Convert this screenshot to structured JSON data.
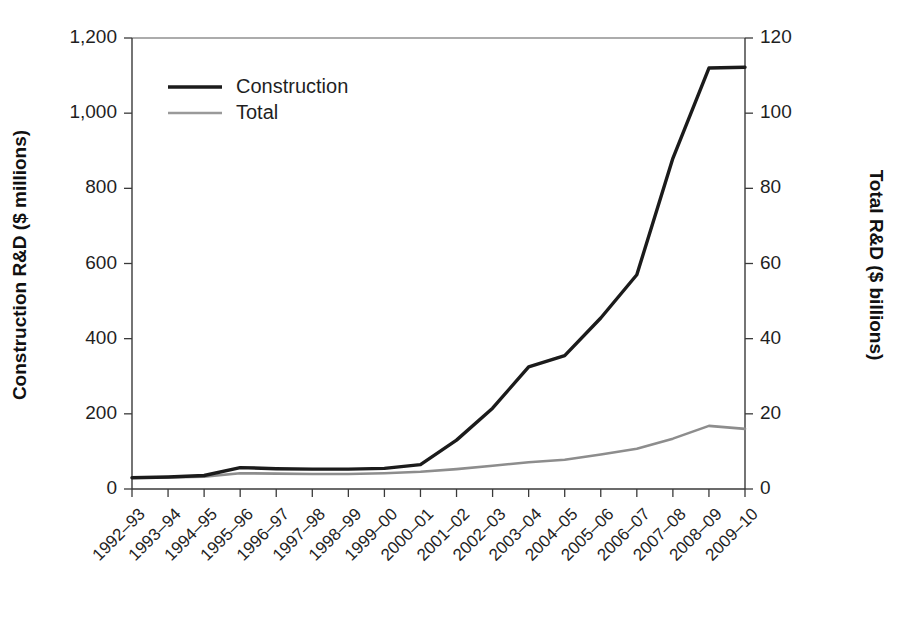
{
  "chart_data": {
    "type": "line",
    "title": "",
    "subtitle": "",
    "xlabel": "",
    "ylabel": "Construction R&D ($ millions)",
    "y2label": "Total R&D ($ billions)",
    "grid": false,
    "legend_position": "top-left",
    "categories": [
      "1992–93",
      "1993–94",
      "1994–95",
      "1995–96",
      "1996–97",
      "1997–98",
      "1998–99",
      "1999–00",
      "2000–01",
      "2001–02",
      "2002–03",
      "2003–04",
      "2004–05",
      "2005–06",
      "2006–07",
      "2007–08",
      "2008–09",
      "2009–10"
    ],
    "ylim": [
      0,
      1200
    ],
    "y2lim": [
      0,
      120
    ],
    "yticks": [
      "0",
      "200",
      "400",
      "600",
      "800",
      "1,000",
      "1,200"
    ],
    "ytick_values": [
      0,
      200,
      400,
      600,
      800,
      1000,
      1200
    ],
    "y2ticks": [
      "0",
      "20",
      "40",
      "60",
      "80",
      "100",
      "120"
    ],
    "y2tick_values": [
      0,
      20,
      40,
      60,
      80,
      100,
      120
    ],
    "series": [
      {
        "name": "Construction",
        "axis": "left",
        "units": "$ millions",
        "color": "#1b1b1b",
        "values": [
          30,
          32,
          36,
          57,
          54,
          53,
          53,
          55,
          65,
          130,
          215,
          325,
          355,
          455,
          570,
          880,
          1120,
          1122
        ]
      },
      {
        "name": "Total",
        "axis": "right",
        "units": "$ billions",
        "color": "#8d8d8d",
        "values": [
          3.0,
          3.1,
          3.3,
          4.2,
          4.1,
          4.0,
          4.0,
          4.2,
          4.6,
          5.3,
          6.2,
          7.1,
          7.8,
          9.2,
          10.7,
          13.4,
          16.8,
          16.0
        ]
      }
    ],
    "legend": [
      {
        "label": "Construction",
        "style": "thick-black-line"
      },
      {
        "label": "Total",
        "style": "thin-gray-line"
      }
    ]
  }
}
